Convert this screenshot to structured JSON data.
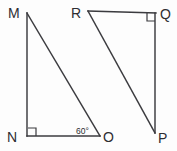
{
  "figure": {
    "background_color": "#fdfdfd",
    "stroke_color": "#3b3b3f",
    "text_color": "#2e2e32",
    "triangles": [
      {
        "name": "triangle-mno",
        "vertices": [
          {
            "label": "M",
            "x": 27,
            "y": 13,
            "label_x": 8,
            "label_y": 18
          },
          {
            "label": "N",
            "x": 27,
            "y": 136,
            "label_x": 7,
            "label_y": 142
          },
          {
            "label": "O",
            "x": 100,
            "y": 136,
            "label_x": 103,
            "label_y": 142
          }
        ],
        "edges": [
          {
            "name": "segment-mn",
            "from": "M",
            "to": "N"
          },
          {
            "name": "segment-no",
            "from": "N",
            "to": "O"
          },
          {
            "name": "segment-mo",
            "from": "M",
            "to": "O"
          }
        ],
        "right_angle_at": "N",
        "angle_marks": [
          {
            "at": "O",
            "value": "60°",
            "label_x": 76,
            "label_y": 134
          }
        ]
      },
      {
        "name": "triangle-rqp",
        "vertices": [
          {
            "label": "R",
            "x": 88,
            "y": 11,
            "label_x": 71,
            "label_y": 18
          },
          {
            "label": "Q",
            "x": 156,
            "y": 13,
            "label_x": 160,
            "label_y": 19
          },
          {
            "label": "P",
            "x": 155,
            "y": 133,
            "label_x": 158,
            "label_y": 143
          }
        ],
        "edges": [
          {
            "name": "segment-rq",
            "from": "R",
            "to": "Q"
          },
          {
            "name": "segment-qp",
            "from": "Q",
            "to": "P"
          },
          {
            "name": "segment-rp",
            "from": "R",
            "to": "P"
          }
        ],
        "right_angle_at": "Q",
        "angle_marks": []
      }
    ],
    "labels": {
      "m": "M",
      "n": "N",
      "o": "O",
      "r": "R",
      "q": "Q",
      "p": "P",
      "angle_o": "60°"
    }
  }
}
